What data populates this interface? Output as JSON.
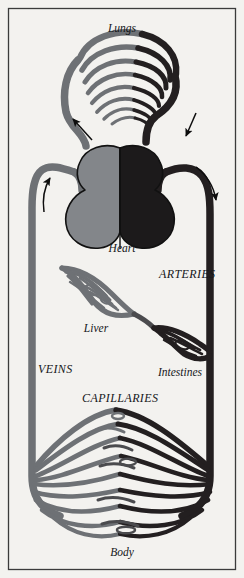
{
  "figure": {
    "background_color": "#f3f2ef",
    "border_color": "#3a3a3a"
  },
  "palette": {
    "arteries_dark": "#231f20",
    "veins_gray": "#6e7175",
    "heart_left_gray": "#83868a",
    "heart_right_dark": "#1c1a1b",
    "outline": "#111111",
    "text": "#15171a"
  },
  "labels": {
    "lungs": "Lungs",
    "heart": "Heart",
    "arteries": "ARTERIES",
    "liver": "Liver",
    "veins": "VEINS",
    "intestines": "Intestines",
    "capillaries": "CAPILLARIES",
    "body": "Body"
  },
  "flow_arrows": [
    {
      "name": "pulmonary-vein-return-arrow",
      "direction": "up-left",
      "region": "left of lungs"
    },
    {
      "name": "pulmonary-artery-outflow-arrow",
      "direction": "down-right",
      "region": "right of lungs"
    },
    {
      "name": "aorta-descending-arrow",
      "direction": "down-right",
      "region": "right of heart"
    },
    {
      "name": "vena-cava-ascending-arrow",
      "direction": "up",
      "region": "left of heart"
    }
  ],
  "structures": [
    {
      "name": "lungs-capillary-bed",
      "label": "Lungs",
      "vessel_type": "mixed"
    },
    {
      "name": "heart-left-chamber",
      "label": "Heart",
      "vessel_type": "vein-side"
    },
    {
      "name": "heart-right-chamber",
      "label": "Heart",
      "vessel_type": "artery-side"
    },
    {
      "name": "liver-capillary-bed",
      "label": "Liver",
      "vessel_type": "vein-side"
    },
    {
      "name": "intestines-capillary-bed",
      "label": "Intestines",
      "vessel_type": "artery-side"
    },
    {
      "name": "body-capillary-bed",
      "label": "Body",
      "vessel_type": "mixed"
    }
  ]
}
